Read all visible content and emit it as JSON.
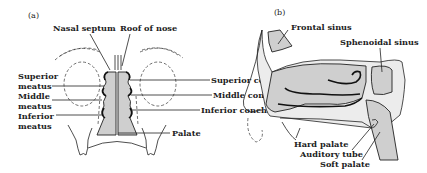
{
  "figure": {
    "panels": [
      {
        "id": "a",
        "label": "(a)",
        "labels": {
          "nasal_septum": "Nasal septum",
          "roof_of_nose": "Roof of nose",
          "superior_meatus_1": "Superior",
          "superior_meatus_2": "meatus",
          "middle_meatus_1": "Middle",
          "middle_meatus_2": "meatus",
          "inferior_meatus_1": "Inferior",
          "inferior_meatus_2": "meatus",
          "superior_concha": "Superior concha",
          "middle_concha": "Middle concha",
          "inferior_concha": "Inferior concha",
          "palate": "Palate"
        }
      },
      {
        "id": "b",
        "label": "(b)",
        "labels": {
          "frontal_sinus": "Frontal sinus",
          "sphenoidal_sinus": "Sphenoidal sinus",
          "hard_palate": "Hard palate",
          "auditory_tube": "Auditory tube",
          "soft_palate": "Soft palate"
        }
      }
    ]
  }
}
